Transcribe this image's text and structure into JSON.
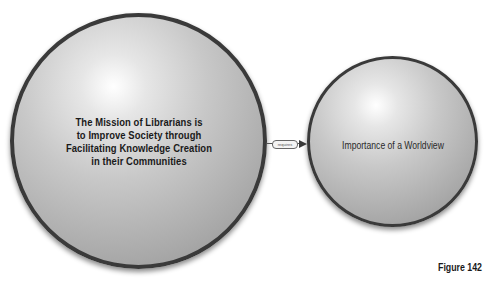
{
  "diagram": {
    "type": "concept-map",
    "nodes": [
      {
        "id": "mission",
        "label": "The Mission of Librarians is to Improve Society through Facilitating Knowledge Creation in their Communities",
        "label_lines": [
          "The Mission of Librarians is",
          "to Improve Society through",
          "Facilitating Knowledge Creation",
          "in their Communities"
        ]
      },
      {
        "id": "worldview",
        "label": "Importance of a Worldview"
      }
    ],
    "edges": [
      {
        "from": "mission",
        "to": "worldview",
        "label": "requires"
      }
    ],
    "colors": {
      "node_border": "#3a3a3a",
      "node_fill_light": "#ffffff",
      "node_fill_dark": "#8e8e8e",
      "text": "#1a1a1a"
    }
  },
  "caption": "Figure 142"
}
